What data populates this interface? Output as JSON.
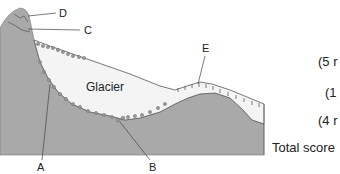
{
  "diagram": {
    "type": "glacial-valley-cross-section",
    "glacier_label": "Glacier",
    "labels": {
      "A": "A",
      "B": "B",
      "C": "C",
      "D": "D",
      "E": "E"
    },
    "colors": {
      "rock": "#a9a9a9",
      "ice": "#f4f4f4",
      "outline": "#555555"
    }
  },
  "marks": [
    {
      "text": "(5 r"
    },
    {
      "text": "(1"
    },
    {
      "text": "(4 r"
    }
  ],
  "total_score_label": "Total score"
}
